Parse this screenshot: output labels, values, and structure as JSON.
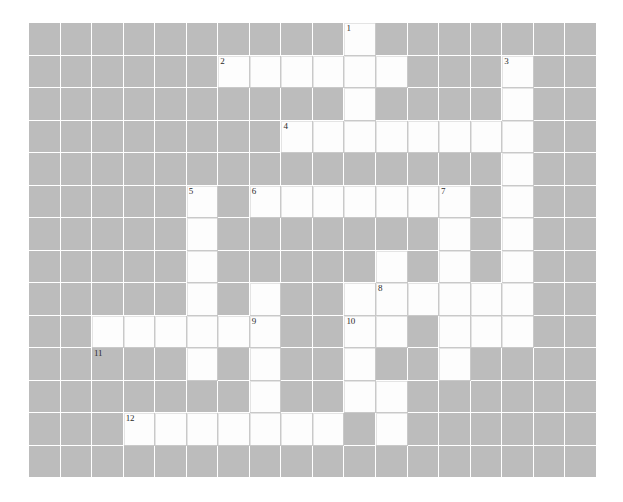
{
  "puzzle": {
    "title": "Crossword Puzzle Grid",
    "columns": 18,
    "rows": 14,
    "cell_size_px": 31.5,
    "colors": {
      "block": "#bcbcbc",
      "open": "#fdfdfd",
      "grid_line": "#ffffff",
      "cell_border": "#c9c9c9",
      "number_text": "#2a2a2a",
      "page_background": "#ffffff"
    },
    "clue_numbers": [
      "1",
      "2",
      "3",
      "4",
      "5",
      "6",
      "7",
      "8",
      "9",
      "10",
      "11",
      "12"
    ],
    "open_cells": [
      [
        0,
        10
      ],
      [
        1,
        6
      ],
      [
        1,
        7
      ],
      [
        1,
        8
      ],
      [
        1,
        9
      ],
      [
        1,
        10
      ],
      [
        1,
        11
      ],
      [
        1,
        15
      ],
      [
        2,
        10
      ],
      [
        2,
        15
      ],
      [
        3,
        8
      ],
      [
        3,
        9
      ],
      [
        3,
        10
      ],
      [
        3,
        11
      ],
      [
        3,
        12
      ],
      [
        3,
        13
      ],
      [
        3,
        14
      ],
      [
        3,
        15
      ],
      [
        4,
        15
      ],
      [
        5,
        5
      ],
      [
        5,
        7
      ],
      [
        5,
        8
      ],
      [
        5,
        9
      ],
      [
        5,
        10
      ],
      [
        5,
        11
      ],
      [
        5,
        12
      ],
      [
        5,
        13
      ],
      [
        5,
        15
      ],
      [
        6,
        5
      ],
      [
        6,
        13
      ],
      [
        6,
        15
      ],
      [
        7,
        5
      ],
      [
        7,
        11
      ],
      [
        7,
        13
      ],
      [
        7,
        15
      ],
      [
        8,
        5
      ],
      [
        8,
        7
      ],
      [
        8,
        10
      ],
      [
        8,
        11
      ],
      [
        8,
        12
      ],
      [
        8,
        13
      ],
      [
        8,
        14
      ],
      [
        8,
        15
      ],
      [
        9,
        2
      ],
      [
        9,
        3
      ],
      [
        9,
        4
      ],
      [
        9,
        5
      ],
      [
        9,
        6
      ],
      [
        9,
        7
      ],
      [
        9,
        10
      ],
      [
        9,
        11
      ],
      [
        9,
        13
      ],
      [
        9,
        14
      ],
      [
        9,
        15
      ],
      [
        10,
        5
      ],
      [
        10,
        7
      ],
      [
        10,
        10
      ],
      [
        10,
        13
      ],
      [
        11,
        7
      ],
      [
        11,
        10
      ],
      [
        11,
        11
      ],
      [
        12,
        3
      ],
      [
        12,
        4
      ],
      [
        12,
        5
      ],
      [
        12,
        6
      ],
      [
        12,
        7
      ],
      [
        12,
        8
      ],
      [
        12,
        9
      ],
      [
        12,
        11
      ]
    ],
    "numbered_cells": [
      {
        "row": 0,
        "col": 10,
        "number": "1"
      },
      {
        "row": 1,
        "col": 6,
        "number": "2"
      },
      {
        "row": 1,
        "col": 15,
        "number": "3"
      },
      {
        "row": 3,
        "col": 8,
        "number": "4"
      },
      {
        "row": 5,
        "col": 5,
        "number": "5"
      },
      {
        "row": 5,
        "col": 7,
        "number": "6"
      },
      {
        "row": 5,
        "col": 13,
        "number": "7"
      },
      {
        "row": 8,
        "col": 11,
        "number": "8"
      },
      {
        "row": 9,
        "col": 7,
        "number": "9"
      },
      {
        "row": 9,
        "col": 10,
        "number": "10"
      },
      {
        "row": 10,
        "col": 2,
        "number": "11"
      },
      {
        "row": 12,
        "col": 3,
        "number": "12"
      }
    ]
  }
}
